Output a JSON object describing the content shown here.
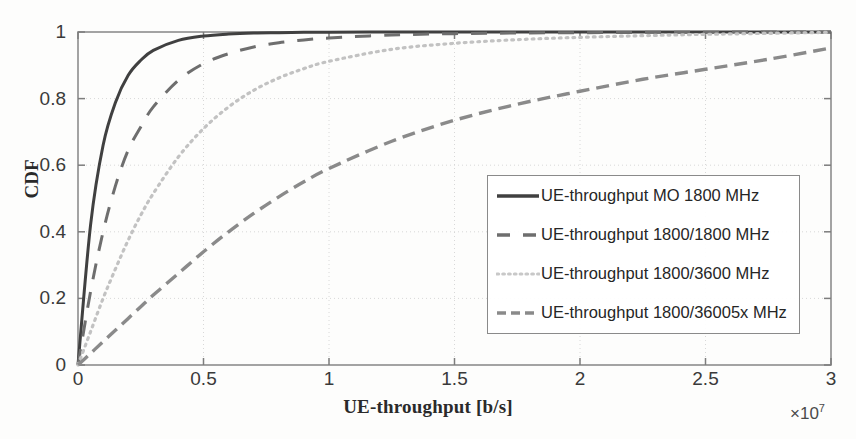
{
  "chart_data": {
    "type": "line",
    "title": "",
    "xlabel": "UE-throughput [b/s]",
    "ylabel": "CDF",
    "x_exponent_prefix": "×",
    "x_exponent_base": "10",
    "x_exponent_power": "7",
    "xlim": [
      0,
      3
    ],
    "ylim": [
      0,
      1
    ],
    "x_scale_note": "x tick values are in units of 1e7 b/s",
    "xticks": [
      "0",
      "0.5",
      "1",
      "1.5",
      "2",
      "2.5",
      "3"
    ],
    "xtick_values": [
      0,
      0.5,
      1,
      1.5,
      2,
      2.5,
      3
    ],
    "yticks": [
      "0",
      "0.2",
      "0.4",
      "0.6",
      "0.8",
      "1"
    ],
    "ytick_values": [
      0,
      0.2,
      0.4,
      0.6,
      0.8,
      1
    ],
    "grid": true,
    "legend_position": "lower-right-inside",
    "x_sample": [
      0,
      0.05,
      0.1,
      0.15,
      0.2,
      0.25,
      0.3,
      0.4,
      0.5,
      0.6,
      0.7,
      0.8,
      0.9,
      1.0,
      1.25,
      1.5,
      1.75,
      2.0,
      2.25,
      2.5,
      2.75,
      3.0
    ],
    "series": [
      {
        "name": "UE-throughput MO 1800 MHz",
        "style": "solid",
        "color": "#404040",
        "width": 3.0,
        "values": [
          0,
          0.42,
          0.66,
          0.79,
          0.87,
          0.915,
          0.945,
          0.975,
          0.988,
          0.994,
          0.997,
          0.998,
          0.999,
          0.9995,
          1.0,
          1.0,
          1.0,
          1.0,
          1.0,
          1.0,
          1.0,
          1.0
        ]
      },
      {
        "name": "UE-throughput 1800/1800 MHz",
        "style": "dashed",
        "color": "#6e6e6e",
        "width": 3.0,
        "values": [
          0,
          0.22,
          0.4,
          0.54,
          0.645,
          0.715,
          0.775,
          0.855,
          0.905,
          0.935,
          0.955,
          0.968,
          0.976,
          0.982,
          0.991,
          0.995,
          0.997,
          0.998,
          0.999,
          0.9995,
          1.0,
          1.0
        ]
      },
      {
        "name": "UE-throughput 1800/3600 MHz",
        "style": "dotted",
        "color": "#c2c2c2",
        "width": 3.2,
        "values": [
          0,
          0.1,
          0.2,
          0.29,
          0.375,
          0.45,
          0.515,
          0.625,
          0.71,
          0.775,
          0.825,
          0.862,
          0.89,
          0.912,
          0.948,
          0.966,
          0.977,
          0.984,
          0.989,
          0.993,
          0.996,
          0.999
        ]
      },
      {
        "name": "UE-throughput 1800/36005x MHz",
        "style": "long-dashed",
        "color": "#8a8a8a",
        "width": 3.4,
        "values": [
          0,
          0.035,
          0.07,
          0.105,
          0.14,
          0.175,
          0.21,
          0.275,
          0.34,
          0.4,
          0.455,
          0.505,
          0.55,
          0.59,
          0.672,
          0.735,
          0.783,
          0.822,
          0.858,
          0.888,
          0.918,
          0.952
        ]
      }
    ]
  },
  "axes": {
    "y_title": "CDF",
    "x_title": "UE-throughput [b/s]"
  },
  "legend": {
    "entries": [
      {
        "label": "UE-throughput MO 1800 MHz",
        "style": "solid",
        "color": "#404040"
      },
      {
        "label": "UE-throughput 1800/1800 MHz",
        "style": "dashed",
        "color": "#6e6e6e"
      },
      {
        "label": "UE-throughput 1800/3600 MHz",
        "style": "dotted",
        "color": "#c2c2c2"
      },
      {
        "label": "UE-throughput 1800/36005x MHz",
        "style": "long-dashed",
        "color": "#8a8a8a"
      }
    ]
  }
}
